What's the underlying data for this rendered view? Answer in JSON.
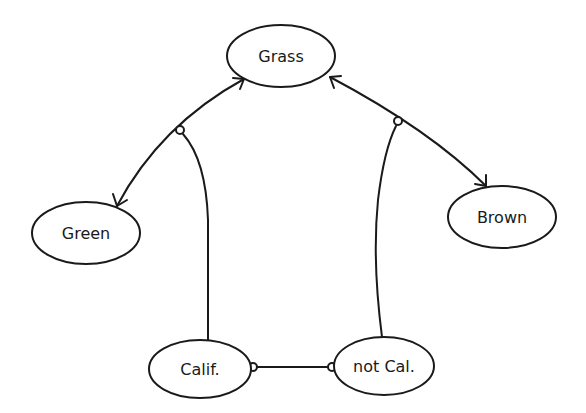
{
  "diagram": {
    "background": "#ffffff",
    "stroke_color": "#1a1a1a",
    "nodes": [
      {
        "id": "grass",
        "label": "Grass",
        "cx": 281,
        "cy": 56,
        "rx": 54,
        "ry": 31
      },
      {
        "id": "green",
        "label": "Green",
        "cx": 86,
        "cy": 233,
        "rx": 54,
        "ry": 31
      },
      {
        "id": "brown",
        "label": "Brown",
        "cx": 502,
        "cy": 217,
        "rx": 54,
        "ry": 31
      },
      {
        "id": "calif",
        "label": "Calif.",
        "cx": 200,
        "cy": 369,
        "rx": 51,
        "ry": 29
      },
      {
        "id": "not_cal",
        "label": "not Cal.",
        "cx": 384,
        "cy": 366,
        "rx": 50,
        "ry": 29
      }
    ],
    "edges": [
      {
        "from": "grass",
        "to": "green",
        "type": "bidirectional-arrow"
      },
      {
        "from": "grass",
        "to": "brown",
        "type": "bidirectional-arrow"
      },
      {
        "from": "calif",
        "to": "grass-green-edge",
        "type": "junction-link"
      },
      {
        "from": "not_cal",
        "to": "grass-brown-edge",
        "type": "junction-link"
      },
      {
        "from": "calif",
        "to": "not_cal",
        "type": "junction-link"
      }
    ]
  }
}
